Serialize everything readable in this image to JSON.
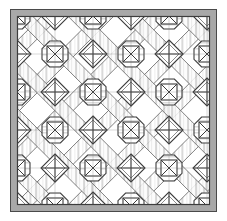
{
  "figure": {
    "type": "ornamental-tiling-diagram",
    "canvas": {
      "width": 227,
      "height": 221
    },
    "background_color": "#ffffff"
  },
  "frame": {
    "name": "outer-border-frame",
    "x": 10,
    "y": 9,
    "width": 207,
    "height": 203,
    "band_thickness": 7,
    "band_fill": "#a8a8a8",
    "outline_color": "#4a4a4a",
    "outline_width": 1,
    "inner_x": 17,
    "inner_y": 16,
    "inner_width": 193,
    "inner_height": 189
  },
  "palette": {
    "stripe_light": "#f4f4f4",
    "stripe_mid": "#d6d6d6",
    "stripe_dark": "#b4b4b4",
    "field_white": "#ffffff",
    "line_color": "#3c3c3c",
    "line_soft": "#6e6e6e",
    "frame_gray": "#a8a8a8"
  },
  "lattice": {
    "name": "diagonal-band-lattice",
    "period": 38,
    "angle_degrees": 45,
    "band_width": 13,
    "origin_x": 17,
    "origin_y": 16,
    "columns": 6,
    "rows": 6,
    "description": "45-degree hatched bands crossing to form an octagon-and-diamond lattice"
  },
  "motifs": [
    {
      "id": "octagon-square-x",
      "label": "Octagon enclosing square with diagonal cross",
      "parity": "even",
      "radius": 13,
      "inner_square_half": 8,
      "count": 18
    },
    {
      "id": "diamond-plus",
      "label": "Diamond enclosing orthogonal cross",
      "parity": "odd",
      "radius": 14,
      "count": 18
    }
  ],
  "hatch": {
    "stripe_pitch": 4,
    "stripe_thickness": 2,
    "tone_sequence": [
      "#f4f4f4",
      "#d6d6d6",
      "#ffffff",
      "#c9c9c9"
    ]
  },
  "centers_x": [
    17,
    55,
    93,
    131,
    169,
    207
  ],
  "centers_y": [
    16,
    54,
    92,
    130,
    168,
    205
  ]
}
